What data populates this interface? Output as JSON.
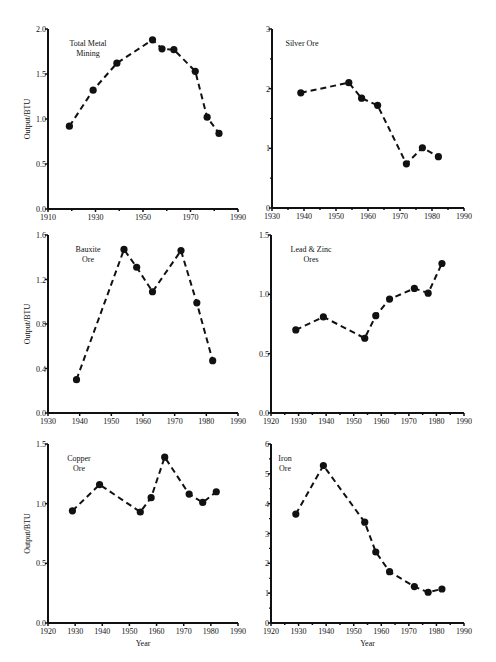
{
  "chart_data": [
    {
      "type": "line",
      "title": "Total Metal Mining",
      "title_lines": [
        "Total Metal",
        "Mining"
      ],
      "xlabel": "",
      "ylabel": "Output/BTU",
      "xlim": [
        1910,
        1990
      ],
      "ylim": [
        0,
        2.0
      ],
      "xticks": [
        1910,
        1930,
        1950,
        1970,
        1990
      ],
      "xminor": [
        1920,
        1940,
        1960,
        1980
      ],
      "yticks": [
        "0.0",
        "0.5",
        "1.0",
        "1.5",
        "2.0"
      ],
      "ytick_values": [
        0,
        0.5,
        1.0,
        1.5,
        2.0
      ],
      "grid": false,
      "x": [
        1919,
        1929,
        1939,
        1954,
        1958,
        1963,
        1972,
        1977,
        1982
      ],
      "y": [
        0.92,
        1.32,
        1.62,
        1.88,
        1.78,
        1.77,
        1.53,
        1.02,
        0.84
      ],
      "box": {
        "l": 48,
        "r": 238,
        "t": 29,
        "b": 209
      }
    },
    {
      "type": "line",
      "title": "Silver Ore",
      "title_lines": [
        "Silver Ore"
      ],
      "xlabel": "",
      "ylabel": "",
      "xlim": [
        1930,
        1990
      ],
      "ylim": [
        0,
        3
      ],
      "xticks": [
        1930,
        1940,
        1950,
        1960,
        1970,
        1980,
        1990
      ],
      "xminor": [
        1935,
        1945,
        1955,
        1965,
        1975,
        1985
      ],
      "yticks": [
        "0",
        "1",
        "2",
        "3"
      ],
      "ytick_values": [
        0,
        1,
        2,
        3
      ],
      "yminor": [
        0.5,
        1.5,
        2.5
      ],
      "grid": false,
      "x": [
        1939,
        1954,
        1958,
        1963,
        1972,
        1977,
        1982
      ],
      "y": [
        1.93,
        2.1,
        1.84,
        1.72,
        0.74,
        1.01,
        0.86
      ],
      "box": {
        "l": 272,
        "r": 464,
        "t": 29,
        "b": 208
      }
    },
    {
      "type": "line",
      "title": "Bauxite Ore",
      "title_lines": [
        "Bauxite",
        "Ore"
      ],
      "xlabel": "",
      "ylabel": "Output/BTU",
      "xlim": [
        1930,
        1990
      ],
      "ylim": [
        0,
        1.6
      ],
      "xticks": [
        1930,
        1940,
        1950,
        1960,
        1970,
        1980,
        1990
      ],
      "xminor": [],
      "yticks": [
        "0.0",
        "0.4",
        "0.8",
        "1.2",
        "1.6"
      ],
      "ytick_values": [
        0,
        0.4,
        0.8,
        1.2,
        1.6
      ],
      "grid": false,
      "x": [
        1939,
        1954,
        1958,
        1963,
        1972,
        1977,
        1982
      ],
      "y": [
        0.3,
        1.47,
        1.31,
        1.09,
        1.46,
        0.99,
        0.47
      ],
      "box": {
        "l": 48,
        "r": 238,
        "t": 235,
        "b": 413
      }
    },
    {
      "type": "line",
      "title": "Lead & Zinc Ores",
      "title_lines": [
        "Lead & Zinc",
        "Ores"
      ],
      "xlabel": "",
      "ylabel": "",
      "xlim": [
        1920,
        1990
      ],
      "ylim": [
        0,
        1.5
      ],
      "xticks": [
        1920,
        1930,
        1940,
        1950,
        1960,
        1970,
        1980,
        1990
      ],
      "xminor": [
        1925,
        1935,
        1945,
        1955,
        1965,
        1975,
        1985
      ],
      "yticks": [
        "0.0",
        "0.5",
        "1.0",
        "1.5"
      ],
      "ytick_values": [
        0,
        0.5,
        1.0,
        1.5
      ],
      "grid": false,
      "x": [
        1929,
        1939,
        1954,
        1958,
        1963,
        1972,
        1977,
        1982
      ],
      "y": [
        0.7,
        0.81,
        0.63,
        0.82,
        0.96,
        1.05,
        1.01,
        1.26
      ],
      "box": {
        "l": 271,
        "r": 464,
        "t": 235,
        "b": 413
      }
    },
    {
      "type": "line",
      "title": "Copper Ore",
      "title_lines": [
        "Copper",
        "Ore"
      ],
      "xlabel": "Year",
      "ylabel": "Output/BTU",
      "xlim": [
        1920,
        1990
      ],
      "ylim": [
        0,
        1.5
      ],
      "xticks": [
        1920,
        1930,
        1940,
        1950,
        1960,
        1970,
        1980,
        1990
      ],
      "xminor": [],
      "yticks": [
        "0.0",
        "0.5",
        "1.0",
        "1.5"
      ],
      "ytick_values": [
        0,
        0.5,
        1.0,
        1.5
      ],
      "grid": false,
      "x": [
        1929,
        1939,
        1954,
        1958,
        1963,
        1972,
        1977,
        1982
      ],
      "y": [
        0.94,
        1.16,
        0.93,
        1.05,
        1.39,
        1.08,
        1.01,
        1.1
      ],
      "box": {
        "l": 48,
        "r": 238,
        "t": 444,
        "b": 623
      }
    },
    {
      "type": "line",
      "title": "Iron Ore",
      "title_lines": [
        "Iron",
        "Ore"
      ],
      "xlabel": "Year",
      "ylabel": "",
      "xlim": [
        1920,
        1990
      ],
      "ylim": [
        0,
        6
      ],
      "xticks": [
        1920,
        1930,
        1940,
        1950,
        1960,
        1970,
        1980,
        1990
      ],
      "xminor": [
        1925,
        1935,
        1945,
        1955,
        1965,
        1975,
        1985
      ],
      "yticks": [
        "0",
        "1",
        "2",
        "3",
        "4",
        "5",
        "6"
      ],
      "ytick_values": [
        0,
        1,
        2,
        3,
        4,
        5,
        6
      ],
      "yminor": [
        0.5,
        1.5,
        2.5,
        3.5,
        4.5,
        5.5
      ],
      "grid": false,
      "x": [
        1929,
        1939,
        1954,
        1958,
        1963,
        1972,
        1977,
        1982
      ],
      "y": [
        3.65,
        5.28,
        3.38,
        2.38,
        1.72,
        1.22,
        1.03,
        1.14
      ],
      "box": {
        "l": 271,
        "r": 464,
        "t": 444,
        "b": 623
      }
    }
  ]
}
